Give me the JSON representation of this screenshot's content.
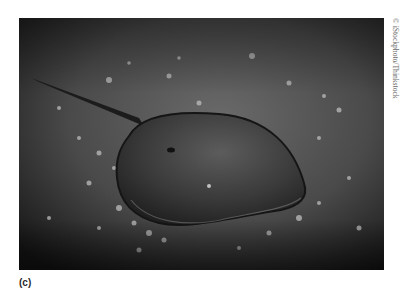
{
  "figure": {
    "label": "(c)",
    "credit": "© iStockphoto/Thinkstock",
    "image_alt": "Horseshoe crab on a sandy beach scattered with small shells and pebbles (black and white photograph)",
    "colors": {
      "background": "#ffffff",
      "sand_dark": "#1e1e1e",
      "sand_mid": "#5a5a5a",
      "shell_dark": "#2c2c2c",
      "shell_light": "#6e6e6e",
      "pebbles": "#bdbdbd"
    }
  }
}
